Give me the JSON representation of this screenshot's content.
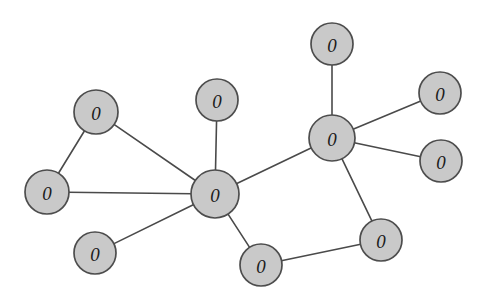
{
  "figure": {
    "kind": "graph-network-diagram",
    "background_color": "#ffffff",
    "width": 488,
    "height": 301,
    "node_fill_color": "#c9c9c9",
    "node_stroke_color": "#4d4d4d",
    "edge_color": "#4a4a4a",
    "label_color": "#1a1a1a",
    "node_count": "11",
    "edge_count": "12"
  },
  "graph_data": {
    "type": "node-link-graph",
    "directed": false,
    "default_node_label": "0",
    "nodes": [
      {
        "id": "n0",
        "label": "0",
        "x": 96,
        "y": 112,
        "r": 22,
        "name": "node-top-left"
      },
      {
        "id": "n1",
        "label": "0",
        "x": 47,
        "y": 192,
        "r": 22,
        "name": "node-left"
      },
      {
        "id": "n2",
        "label": "0",
        "x": 217,
        "y": 100,
        "r": 21,
        "name": "node-upper-middle"
      },
      {
        "id": "n3",
        "label": "0",
        "x": 215,
        "y": 194,
        "r": 24,
        "name": "node-center-hub"
      },
      {
        "id": "n4",
        "label": "0",
        "x": 95,
        "y": 253,
        "r": 21,
        "name": "node-bottom-left"
      },
      {
        "id": "n5",
        "label": "0",
        "x": 261,
        "y": 265,
        "r": 21,
        "name": "node-bottom-center"
      },
      {
        "id": "n6",
        "label": "0",
        "x": 332,
        "y": 138,
        "r": 23,
        "name": "node-right-hub"
      },
      {
        "id": "n7",
        "label": "0",
        "x": 332,
        "y": 44,
        "r": 21,
        "name": "node-top"
      },
      {
        "id": "n8",
        "label": "0",
        "x": 440,
        "y": 93,
        "r": 21,
        "name": "node-upper-right"
      },
      {
        "id": "n9",
        "label": "0",
        "x": 441,
        "y": 161,
        "r": 21,
        "name": "node-lower-right"
      },
      {
        "id": "n10",
        "label": "0",
        "x": 381,
        "y": 240,
        "r": 21,
        "name": "node-bottom-right"
      }
    ],
    "edges": [
      {
        "source": "n0",
        "target": "n1",
        "name": "edge-top-left-to-left"
      },
      {
        "source": "n0",
        "target": "n3",
        "name": "edge-top-left-to-center-hub"
      },
      {
        "source": "n1",
        "target": "n3",
        "name": "edge-left-to-center-hub"
      },
      {
        "source": "n2",
        "target": "n3",
        "name": "edge-upper-middle-to-center-hub"
      },
      {
        "source": "n3",
        "target": "n4",
        "name": "edge-center-hub-to-bottom-left"
      },
      {
        "source": "n3",
        "target": "n5",
        "name": "edge-center-hub-to-bottom-center"
      },
      {
        "source": "n3",
        "target": "n6",
        "name": "edge-center-hub-to-right-hub"
      },
      {
        "source": "n5",
        "target": "n10",
        "name": "edge-bottom-center-to-bottom-right"
      },
      {
        "source": "n6",
        "target": "n7",
        "name": "edge-right-hub-to-top"
      },
      {
        "source": "n6",
        "target": "n8",
        "name": "edge-right-hub-to-upper-right"
      },
      {
        "source": "n6",
        "target": "n9",
        "name": "edge-right-hub-to-lower-right"
      },
      {
        "source": "n6",
        "target": "n10",
        "name": "edge-right-hub-to-bottom-right"
      }
    ]
  }
}
